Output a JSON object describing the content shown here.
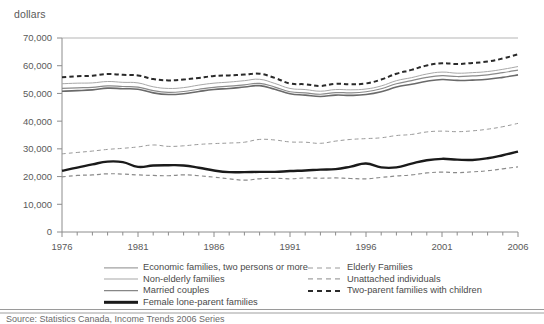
{
  "axis_unit_label": "dollars",
  "source": "Source: Statistics Canada, Income Trends 2006 Series",
  "legend": {
    "left_column": [
      {
        "label": "Economic families, two persons or more",
        "style": "solid",
        "width": 1.2,
        "color": "#8a8a8a"
      },
      {
        "label": "Non-elderly families",
        "style": "solid",
        "width": 1.0,
        "color": "#a8a8a8"
      },
      {
        "label": "Married couples",
        "style": "solid",
        "width": 1.6,
        "color": "#6a6a6a"
      },
      {
        "label": "Female lone-parent families",
        "style": "solid",
        "width": 2.4,
        "color": "#1a1a1a"
      }
    ],
    "right_column": [
      {
        "label": "Elderly Families",
        "style": "dashed",
        "width": 1.0,
        "color": "#9a9a9a"
      },
      {
        "label": "Unattached individuals",
        "style": "dashed",
        "width": 1.2,
        "color": "#8a8a8a"
      },
      {
        "label": "Two-parent families with children",
        "style": "dashed",
        "width": 2.0,
        "color": "#2a2a2a"
      }
    ]
  },
  "chart_data": {
    "type": "line",
    "title": "",
    "xlabel": "",
    "ylabel": "dollars",
    "xlim": [
      1976,
      2006
    ],
    "ylim": [
      0,
      70000
    ],
    "grid": false,
    "legend_position": "bottom",
    "y_ticks": [
      0,
      10000,
      20000,
      30000,
      40000,
      50000,
      60000,
      70000
    ],
    "y_tick_labels": [
      "0",
      "10,000",
      "20,000",
      "30,000",
      "40,000",
      "50,000",
      "60,000",
      "70,000"
    ],
    "x_ticks": [
      1976,
      1977,
      1978,
      1979,
      1980,
      1981,
      1982,
      1983,
      1984,
      1985,
      1986,
      1987,
      1988,
      1989,
      1990,
      1991,
      1992,
      1993,
      1994,
      1995,
      1996,
      1997,
      1998,
      1999,
      2000,
      2001,
      2002,
      2003,
      2004,
      2005,
      2006
    ],
    "x_tick_labels_shown": [
      "1976",
      "1981",
      "1986",
      "1991",
      "1996",
      "2001",
      "2006"
    ],
    "x": [
      1976,
      1977,
      1978,
      1979,
      1980,
      1981,
      1982,
      1983,
      1984,
      1985,
      1986,
      1987,
      1988,
      1989,
      1990,
      1991,
      1992,
      1993,
      1994,
      1995,
      1996,
      1997,
      1998,
      1999,
      2000,
      2001,
      2002,
      2003,
      2004,
      2005,
      2006
    ],
    "series": [
      {
        "name": "Two-parent families with children",
        "style": "dashed",
        "color": "#2a2a2a",
        "width": 2.0,
        "values": [
          55800,
          56200,
          56400,
          57000,
          56700,
          56500,
          55200,
          54700,
          55000,
          55600,
          56300,
          56500,
          56800,
          57100,
          55600,
          53600,
          53300,
          52700,
          53500,
          53300,
          53600,
          55000,
          57100,
          58500,
          60100,
          60900,
          60600,
          61000,
          61500,
          62600,
          64100
        ]
      },
      {
        "name": "Non-elderly families",
        "style": "solid",
        "color": "#a8a8a8",
        "width": 1.0,
        "values": [
          53500,
          53700,
          53800,
          54300,
          54000,
          53800,
          52400,
          51800,
          52100,
          53000,
          53700,
          54100,
          54600,
          55100,
          53600,
          51800,
          51400,
          50800,
          51400,
          51300,
          51600,
          52700,
          54600,
          55700,
          57000,
          57700,
          57300,
          57500,
          57900,
          58700,
          59700
        ]
      },
      {
        "name": "Economic families, two persons or more",
        "style": "solid",
        "color": "#8a8a8a",
        "width": 1.2,
        "values": [
          51800,
          52000,
          52200,
          52700,
          52500,
          52300,
          51000,
          50400,
          50700,
          51500,
          52200,
          52600,
          53100,
          53600,
          52300,
          50600,
          50200,
          49700,
          50300,
          50200,
          50600,
          51700,
          53500,
          54600,
          55800,
          56400,
          56100,
          56300,
          56700,
          57500,
          58400
        ]
      },
      {
        "name": "Married couples",
        "style": "solid",
        "color": "#6a6a6a",
        "width": 1.6,
        "values": [
          50800,
          51000,
          51300,
          51900,
          51700,
          51500,
          50200,
          49600,
          49900,
          50700,
          51400,
          51800,
          52300,
          52800,
          51500,
          49900,
          49400,
          48900,
          49400,
          49300,
          49600,
          50600,
          52300,
          53300,
          54400,
          55000,
          54700,
          54800,
          55100,
          55800,
          56700
        ]
      },
      {
        "name": "Elderly Families",
        "style": "dashed",
        "color": "#9a9a9a",
        "width": 1.0,
        "values": [
          28200,
          28700,
          29200,
          29800,
          30200,
          30700,
          31400,
          30900,
          31100,
          31600,
          31900,
          32100,
          32400,
          33400,
          33200,
          32500,
          32400,
          32000,
          32800,
          33400,
          33700,
          34000,
          34800,
          35200,
          36100,
          36400,
          36200,
          36500,
          37100,
          38000,
          39200
        ]
      },
      {
        "name": "Female lone-parent families",
        "style": "solid",
        "color": "#1a1a1a",
        "width": 2.4,
        "values": [
          22100,
          23200,
          24400,
          25400,
          25200,
          23500,
          24000,
          24100,
          24000,
          23200,
          22200,
          21600,
          21600,
          21700,
          21700,
          22000,
          22200,
          22500,
          22700,
          23600,
          24700,
          23300,
          23300,
          24700,
          25900,
          26400,
          26100,
          26000,
          26600,
          27700,
          29000
        ]
      },
      {
        "name": "Unattached individuals",
        "style": "dashed",
        "color": "#8a8a8a",
        "width": 1.2,
        "values": [
          19900,
          20400,
          20600,
          21000,
          20900,
          20600,
          20400,
          20300,
          20600,
          20300,
          19800,
          19200,
          18700,
          19200,
          19400,
          19200,
          19500,
          19400,
          19500,
          19300,
          19200,
          19700,
          20200,
          20600,
          21300,
          21600,
          21400,
          21700,
          22100,
          22800,
          23500
        ]
      }
    ]
  }
}
